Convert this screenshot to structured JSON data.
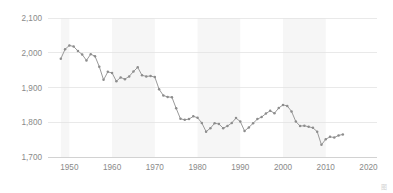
{
  "chart_data": {
    "type": "line",
    "title": "",
    "subtitle": "",
    "xlabel": "",
    "ylabel": "",
    "xlim": [
      1945,
      2022
    ],
    "ylim": [
      1700,
      2100
    ],
    "grid": true,
    "legend": null,
    "legend_position": "none",
    "x_ticks": [
      1950,
      1960,
      1970,
      1980,
      1990,
      2000,
      2010,
      2020
    ],
    "x_tick_labels": [
      "1950",
      "1960",
      "1970",
      "1980",
      "1990",
      "2000",
      "2010",
      "2020"
    ],
    "y_ticks": [
      1700,
      1800,
      1900,
      2000,
      2100
    ],
    "y_tick_labels": [
      "1,700",
      "1,800",
      "1,900",
      "2,000",
      "2,100"
    ],
    "marker": "circle",
    "line_color": "#9a9a9a",
    "marker_color": "#8d8d8d",
    "band_color": "#f6f6f6",
    "gridline_color": "#e3e3e3",
    "tick_label_color": "#8a8a8a",
    "background_bands": [
      [
        1948,
        1950
      ],
      [
        1960,
        1970
      ],
      [
        1980,
        1990
      ],
      [
        2000,
        2010
      ]
    ],
    "x": [
      1948,
      1949,
      1950,
      1951,
      1952,
      1953,
      1954,
      1955,
      1956,
      1957,
      1958,
      1959,
      1960,
      1961,
      1962,
      1963,
      1964,
      1965,
      1966,
      1967,
      1968,
      1969,
      1970,
      1971,
      1972,
      1973,
      1974,
      1975,
      1976,
      1977,
      1978,
      1979,
      1980,
      1981,
      1982,
      1983,
      1984,
      1985,
      1986,
      1987,
      1988,
      1989,
      1990,
      1991,
      1992,
      1993,
      1994,
      1995,
      1996,
      1997,
      1998,
      1999,
      2000,
      2001,
      2002,
      2003,
      2004,
      2005,
      2006,
      2007,
      2008,
      2009,
      2010,
      2011,
      2012,
      2013,
      2014
    ],
    "values": [
      1983,
      2010,
      2021,
      2018,
      2005,
      1995,
      1978,
      1996,
      1990,
      1960,
      1922,
      1945,
      1942,
      1918,
      1929,
      1924,
      1932,
      1946,
      1958,
      1935,
      1932,
      1933,
      1930,
      1895,
      1877,
      1873,
      1872,
      1840,
      1810,
      1807,
      1809,
      1817,
      1813,
      1798,
      1773,
      1783,
      1797,
      1795,
      1783,
      1789,
      1798,
      1812,
      1802,
      1775,
      1785,
      1797,
      1809,
      1815,
      1825,
      1833,
      1826,
      1841,
      1850,
      1847,
      1831,
      1802,
      1789,
      1790,
      1787,
      1784,
      1773,
      1735,
      1751,
      1758,
      1756,
      1762,
      1765
    ],
    "series": [
      {
        "name": "value",
        "values": [
          1983,
          2010,
          2021,
          2018,
          2005,
          1995,
          1978,
          1996,
          1990,
          1960,
          1922,
          1945,
          1942,
          1918,
          1929,
          1924,
          1932,
          1946,
          1958,
          1935,
          1932,
          1933,
          1930,
          1895,
          1877,
          1873,
          1872,
          1840,
          1810,
          1807,
          1809,
          1817,
          1813,
          1798,
          1773,
          1783,
          1797,
          1795,
          1783,
          1789,
          1798,
          1812,
          1802,
          1775,
          1785,
          1797,
          1809,
          1815,
          1825,
          1833,
          1826,
          1841,
          1850,
          1847,
          1831,
          1802,
          1789,
          1790,
          1787,
          1784,
          1773,
          1735,
          1751,
          1758,
          1756,
          1762,
          1765
        ]
      }
    ]
  },
  "watermark": {
    "label": "图"
  }
}
